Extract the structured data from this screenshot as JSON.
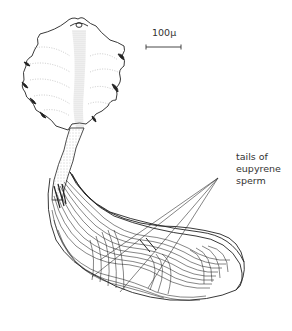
{
  "figure": {
    "scale_bar": {
      "label": "100μ"
    },
    "callout": {
      "lines": [
        "tails of",
        "eupyrene",
        "sperm"
      ]
    }
  }
}
